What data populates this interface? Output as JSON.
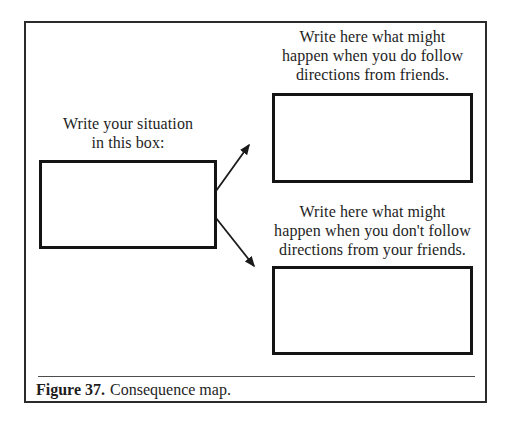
{
  "nodes": {
    "situation": {
      "lines": [
        "Write your situation",
        "in this box:"
      ]
    },
    "follow": {
      "lines": [
        "Write here what might",
        "happen when you do follow",
        "directions from friends."
      ]
    },
    "not_follow": {
      "lines": [
        "Write here what might",
        "happen when you don't follow",
        "directions from your friends."
      ]
    }
  },
  "caption": {
    "label": "Figure 37.",
    "text": "Consequence map."
  },
  "colors": {
    "ink": "#1e1e1e",
    "box_border": "#141414",
    "frame_border": "#2b2b2b",
    "caption_rule": "#4d4d4d",
    "background": "#ffffff"
  }
}
